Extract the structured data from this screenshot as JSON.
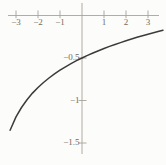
{
  "chart_data": {
    "type": "line",
    "x_ticks": {
      "values": [
        -3,
        -2,
        -1,
        1,
        2,
        3
      ],
      "labels": [
        "−3",
        "−2",
        "−1",
        "1",
        "2",
        "3"
      ]
    },
    "y_ticks": {
      "values": [
        -0.5,
        -1,
        -1.5
      ],
      "labels": [
        "−0.5",
        "−1",
        "−1.5"
      ]
    },
    "x_range": [
      -3.4,
      3.6
    ],
    "y_range": [
      -1.65,
      0.15
    ],
    "grid": false,
    "series": [
      {
        "name": "curve",
        "points": [
          [
            -3.27,
            -1.351
          ],
          [
            -3.0,
            -1.193
          ],
          [
            -2.75,
            -1.082
          ],
          [
            -2.5,
            -0.99
          ],
          [
            -2.25,
            -0.913
          ],
          [
            -2.0,
            -0.847
          ],
          [
            -1.75,
            -0.788
          ],
          [
            -1.5,
            -0.735
          ],
          [
            -1.25,
            -0.687
          ],
          [
            -1.0,
            -0.644
          ],
          [
            -0.75,
            -0.604
          ],
          [
            -0.5,
            -0.567
          ],
          [
            -0.25,
            -0.532
          ],
          [
            0.0,
            -0.5
          ],
          [
            0.25,
            -0.47
          ],
          [
            0.5,
            -0.441
          ],
          [
            0.75,
            -0.414
          ],
          [
            1.0,
            -0.388
          ],
          [
            1.25,
            -0.364
          ],
          [
            1.5,
            -0.341
          ],
          [
            1.75,
            -0.319
          ],
          [
            2.0,
            -0.297
          ],
          [
            2.25,
            -0.277
          ],
          [
            2.5,
            -0.257
          ],
          [
            2.75,
            -0.238
          ],
          [
            3.0,
            -0.22
          ],
          [
            3.25,
            -0.203
          ],
          [
            3.5,
            -0.186
          ],
          [
            3.68,
            -0.174
          ]
        ]
      }
    ],
    "colors": {
      "curve": "#3b3b3b",
      "axis": "#a9a399",
      "tick_label": "#716c63",
      "background": "#fcfcfa"
    }
  }
}
